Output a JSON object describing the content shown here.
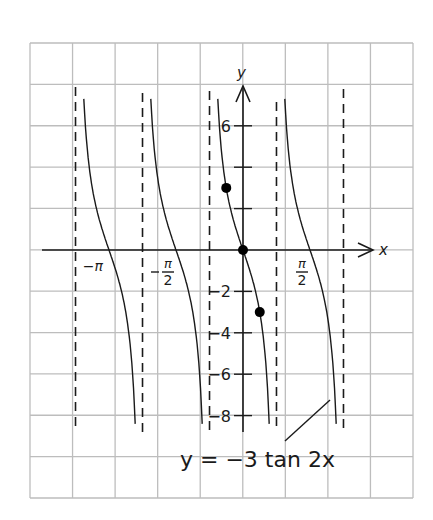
{
  "chart_data": {
    "type": "line",
    "title": "",
    "function_label": "y = −3 tan 2x",
    "xlabel": "x",
    "ylabel": "y",
    "x_tick_labels": [
      {
        "value": -3.14159,
        "text": "−π"
      },
      {
        "value": -1.5708,
        "text": "−π/2",
        "num": "π",
        "den": "2",
        "neg": true
      },
      {
        "value": 1.5708,
        "text": "π/2",
        "num": "π",
        "den": "2",
        "neg": false
      }
    ],
    "y_ticks": [
      6,
      4,
      2,
      -2,
      -4,
      -6,
      -8
    ],
    "y_tick_labels": [
      {
        "value": 6,
        "text": "6"
      },
      {
        "value": -2,
        "text": "−2"
      },
      {
        "value": -4,
        "text": "−4"
      },
      {
        "value": -6,
        "text": "−6"
      },
      {
        "value": -8,
        "text": "−8"
      }
    ],
    "asymptotes": [
      -3.927,
      -2.356,
      -0.785,
      0.785,
      2.356
    ],
    "branches": [
      {
        "center": -3.14159,
        "y_top": 7.3,
        "y_bottom": -8.4
      },
      {
        "center": -1.5708,
        "y_top": 7.3,
        "y_bottom": -8.4
      },
      {
        "center": 0,
        "y_top": 7.3,
        "y_bottom": -8.4
      },
      {
        "center": 1.5708,
        "y_top": 7.3,
        "y_bottom": -8.4
      }
    ],
    "highlighted_points": [
      {
        "x": -0.3927,
        "y": 3,
        "label": "(−π/8, 3)"
      },
      {
        "x": 0,
        "y": 0,
        "label": "(0, 0)"
      },
      {
        "x": 0.3927,
        "y": -3,
        "label": "(π/8, −3)"
      }
    ],
    "xlim_px_grid": "9 columns",
    "ylim": [
      -12,
      10
    ],
    "grid": true,
    "colors": {
      "grid": "#bdbdbd",
      "ink": "#1a1a1a",
      "background": "#ffffff"
    }
  }
}
